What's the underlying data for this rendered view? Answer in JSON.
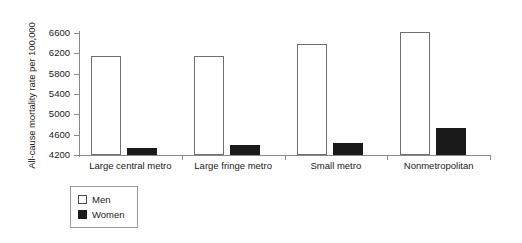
{
  "chart_data": {
    "type": "bar",
    "title": "",
    "xlabel": "",
    "ylabel": "All-cause mortality rate per 100,000",
    "categories": [
      "Large central metro",
      "Large fringe metro",
      "Small metro",
      "Nonmetropolitan"
    ],
    "series": [
      {
        "name": "Men",
        "color": "#ffffff",
        "values": [
          6150,
          6150,
          6380,
          6620
        ]
      },
      {
        "name": "Women",
        "color": "#1a1a1a",
        "values": [
          4330,
          4400,
          4440,
          4730
        ]
      }
    ],
    "ylim": [
      4200,
      6600
    ],
    "yticks": [
      4200,
      4600,
      5000,
      5400,
      5800,
      6200,
      6600
    ],
    "ytick_labels": [
      "4200",
      "4600",
      "5000",
      "5400",
      "5800",
      "6200",
      "6600"
    ],
    "grid": false,
    "legend_position": "bottom-left"
  },
  "legend": {
    "items": [
      {
        "label": "Men",
        "swatch": "open-square-swatch"
      },
      {
        "label": "Women",
        "swatch": "filled-square-swatch"
      }
    ]
  }
}
